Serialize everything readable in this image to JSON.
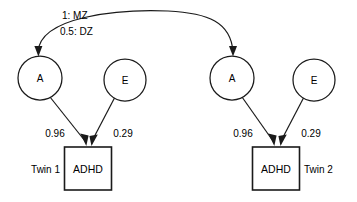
{
  "diagram": {
    "type": "path-diagram",
    "background_color": "#ffffff",
    "stroke_color": "#1a1a1a",
    "correlation_labels": {
      "mz": "1: MZ",
      "dz": "0.5: DZ"
    },
    "twins": [
      {
        "id": "twin-1",
        "side": "left",
        "twin_label": "Twin 1",
        "observed_label": "ADHD",
        "latents": [
          {
            "id": "a",
            "label": "A",
            "coefficient": "0.96"
          },
          {
            "id": "e",
            "label": "E",
            "coefficient": "0.29"
          }
        ]
      },
      {
        "id": "twin-2",
        "side": "right",
        "twin_label": "Twin 2",
        "observed_label": "ADHD",
        "latents": [
          {
            "id": "a",
            "label": "A",
            "coefficient": "0.96"
          },
          {
            "id": "e",
            "label": "E",
            "coefficient": "0.29"
          }
        ]
      }
    ]
  }
}
